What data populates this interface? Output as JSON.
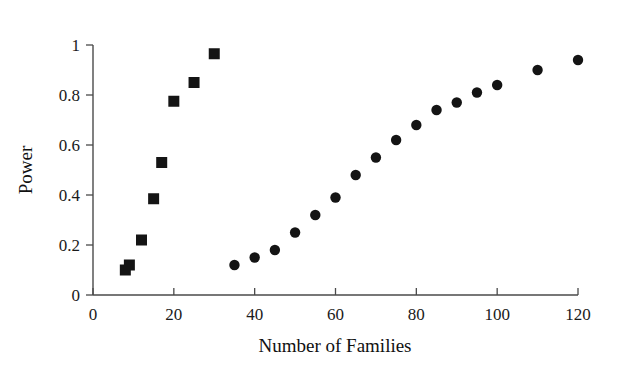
{
  "chart_data": {
    "type": "scatter",
    "title": "",
    "xlabel": "Number of Families",
    "ylabel": "Power",
    "xlim": [
      0,
      120
    ],
    "ylim": [
      0,
      1
    ],
    "xticks": [
      0,
      20,
      40,
      60,
      80,
      100,
      120
    ],
    "xticklabels": [
      "0",
      "20",
      "40",
      "60",
      "80",
      "100",
      "120"
    ],
    "yticks": [
      0,
      0.2,
      0.4,
      0.6,
      0.8,
      1
    ],
    "yticklabels": [
      "0",
      "0.2",
      "0.4",
      "0.6",
      "0.8",
      "1"
    ],
    "grid": false,
    "legend": "none",
    "series": [
      {
        "name": "squares",
        "marker": "square",
        "color": "#141414",
        "points": [
          {
            "x": 8,
            "y": 0.1
          },
          {
            "x": 9,
            "y": 0.12
          },
          {
            "x": 12,
            "y": 0.22
          },
          {
            "x": 15,
            "y": 0.385
          },
          {
            "x": 17,
            "y": 0.53
          },
          {
            "x": 20,
            "y": 0.775
          },
          {
            "x": 25,
            "y": 0.85
          },
          {
            "x": 30,
            "y": 0.965
          }
        ]
      },
      {
        "name": "circles",
        "marker": "circle",
        "color": "#141414",
        "points": [
          {
            "x": 35,
            "y": 0.12
          },
          {
            "x": 40,
            "y": 0.15
          },
          {
            "x": 45,
            "y": 0.18
          },
          {
            "x": 50,
            "y": 0.25
          },
          {
            "x": 55,
            "y": 0.32
          },
          {
            "x": 60,
            "y": 0.39
          },
          {
            "x": 65,
            "y": 0.48
          },
          {
            "x": 70,
            "y": 0.55
          },
          {
            "x": 75,
            "y": 0.62
          },
          {
            "x": 80,
            "y": 0.68
          },
          {
            "x": 85,
            "y": 0.74
          },
          {
            "x": 90,
            "y": 0.77
          },
          {
            "x": 95,
            "y": 0.81
          },
          {
            "x": 100,
            "y": 0.84
          },
          {
            "x": 110,
            "y": 0.9
          },
          {
            "x": 120,
            "y": 0.94
          }
        ]
      }
    ]
  },
  "figure": {
    "background_color": "#ffffff",
    "axis_color": "#4a4a4a",
    "marker_color": "#141414"
  }
}
